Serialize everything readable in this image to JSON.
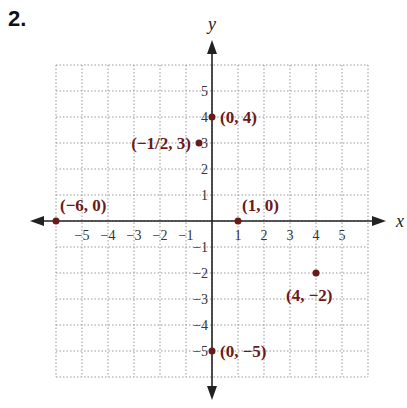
{
  "problem_number": "2.",
  "chart_data": {
    "type": "scatter",
    "title": "",
    "xlabel": "x",
    "ylabel": "y",
    "xlim": [
      -6,
      6
    ],
    "ylim": [
      -6,
      6
    ],
    "grid": true,
    "x_ticks": [
      "−5",
      "−4",
      "−3",
      "−2",
      "−1",
      "1",
      "2",
      "3",
      "4",
      "5"
    ],
    "y_ticks": [
      "5",
      "4",
      "3",
      "2",
      "1",
      "−1",
      "−2",
      "−3",
      "−4",
      "−5"
    ],
    "point_color": "#6b1a1a",
    "points": [
      {
        "x": 0,
        "y": 4,
        "label": "(0, 4)"
      },
      {
        "x": -0.5,
        "y": 3,
        "label": "(−1/2, 3)"
      },
      {
        "x": -6,
        "y": 0,
        "label": "(−6, 0)"
      },
      {
        "x": 1,
        "y": 0,
        "label": "(1, 0)"
      },
      {
        "x": 4,
        "y": -2,
        "label": "(4, −2)"
      },
      {
        "x": 0,
        "y": -5,
        "label": "(0, −5)"
      }
    ]
  }
}
